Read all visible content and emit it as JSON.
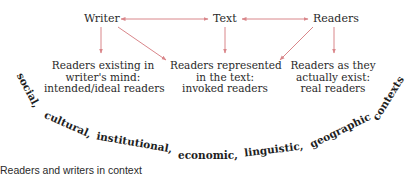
{
  "diagram": {
    "nodes": {
      "writer": "Writer",
      "text": "Text",
      "readers": "Readers"
    },
    "boxes": {
      "ideal": [
        "Readers existing in",
        "writer's mind:",
        "intended/ideal readers"
      ],
      "invoked": [
        "Readers represented",
        "in the text:",
        "invoked readers"
      ],
      "real": [
        "Readers as they",
        "actually exist:",
        "real readers"
      ]
    },
    "contexts": [
      "social,",
      "cultural,",
      "institutional,",
      "economic,",
      "linguistic,",
      "geographic",
      "contexts"
    ],
    "caption": "Readers and writers in context",
    "arrow_color": "#d9868a",
    "arrows": [
      {
        "from": "Writer",
        "to": "Text",
        "type": "bidirectional"
      },
      {
        "from": "Text",
        "to": "Readers",
        "type": "bidirectional"
      },
      {
        "from": "Writer",
        "to": "Readers existing in writer's mind"
      },
      {
        "from": "Writer",
        "to": "Readers represented in the text"
      },
      {
        "from": "Text",
        "to": "Readers represented in the text"
      },
      {
        "from": "Readers",
        "to": "Readers represented in the text"
      },
      {
        "from": "Readers",
        "to": "Readers as they actually exist"
      }
    ]
  }
}
